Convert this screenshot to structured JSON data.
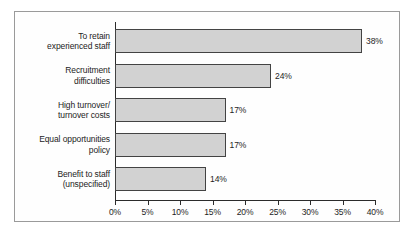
{
  "chart_data": {
    "type": "bar",
    "orientation": "horizontal",
    "title": "",
    "xlabel": "",
    "ylabel": "",
    "categories": [
      "To retain experienced staff",
      "Recruitment difficulties",
      "High turnover/ turnover costs",
      "Equal opportunities policy",
      "Benefit to staff (unspecified)"
    ],
    "category_lines": [
      [
        "To retain",
        "experienced staff"
      ],
      [
        "Recruitment",
        "difficulties"
      ],
      [
        "High turnover/",
        "turnover costs"
      ],
      [
        "Equal opportunities",
        "policy"
      ],
      [
        "Benefit to staff",
        "(unspecified)"
      ]
    ],
    "values": [
      38,
      24,
      17,
      17,
      14
    ],
    "value_labels": [
      "38%",
      "24%",
      "17%",
      "17%",
      "14%"
    ],
    "xlim": [
      0,
      40
    ],
    "xticks": [
      0,
      5,
      10,
      15,
      20,
      25,
      30,
      35,
      40
    ],
    "xtick_labels": [
      "0%",
      "5%",
      "10%",
      "15%",
      "20%",
      "25%",
      "30%",
      "35%",
      "40%"
    ],
    "grid": false,
    "legend": false,
    "bar_color": "#d2d2d2",
    "bar_edge_color": "#434343",
    "axis_color": "#2b2b2b",
    "frame_color": "#9a9a9a",
    "background_color": "#fefefe"
  }
}
